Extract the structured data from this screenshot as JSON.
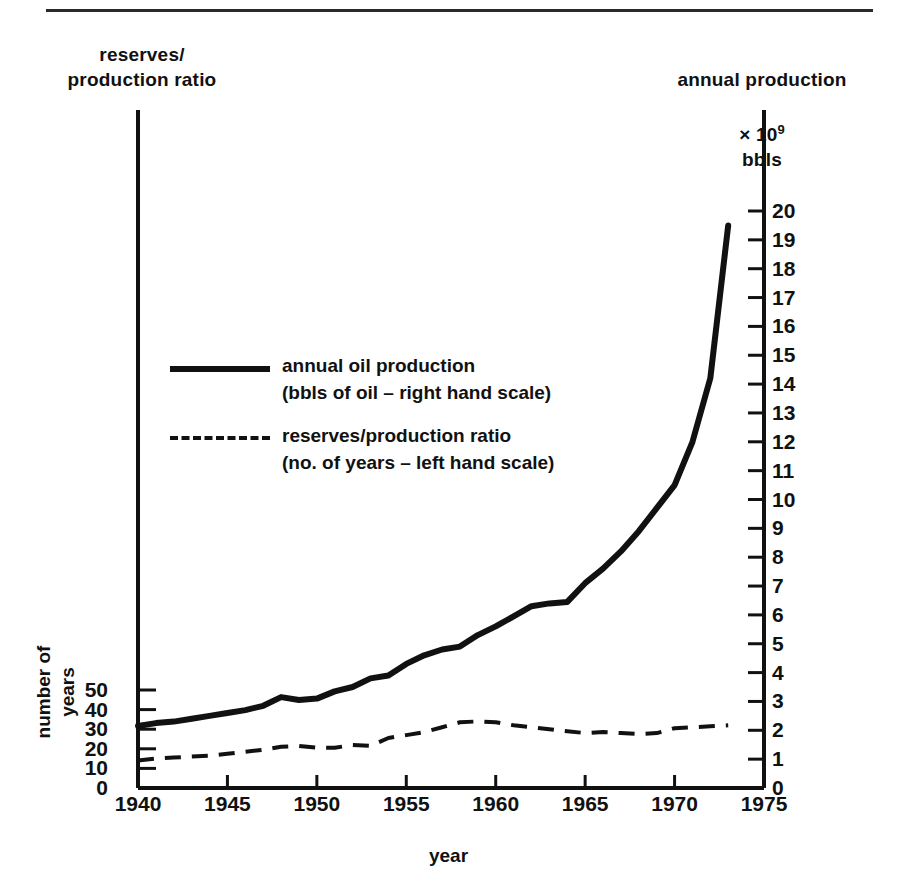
{
  "figure": {
    "left_axis_caption": "reserves/\nproduction ratio",
    "right_axis_caption_line1": "annual production",
    "right_axis_caption_mult": "× 10",
    "right_axis_caption_exp": "9",
    "right_axis_caption_unit": "bbls",
    "left_axis_title": "number of\nyears",
    "x_axis_title": "year"
  },
  "legend": {
    "entries": [
      {
        "style": "solid",
        "label": "annual oil production\n(bbls of oil – right hand scale)"
      },
      {
        "style": "dashed",
        "label": "reserves/production ratio\n(no. of years – left hand scale)"
      }
    ]
  },
  "chart_data": {
    "type": "line",
    "title": "",
    "xlabel": "year",
    "grid": false,
    "legend_position": "inside-upper-left",
    "x_ticks": [
      "1940",
      "1945",
      "1950",
      "1955",
      "1960",
      "1965",
      "1970",
      "1975"
    ],
    "xlim": [
      1940,
      1975
    ],
    "left_axis": {
      "label": "number of years",
      "caption": "reserves/production ratio",
      "ylim": [
        0,
        60
      ],
      "ticks": [
        "0",
        "10",
        "20",
        "30",
        "40",
        "50"
      ],
      "tick_values": [
        0,
        10,
        20,
        30,
        40,
        50
      ]
    },
    "right_axis": {
      "label": "annual production × 10^9 bbls",
      "ylim": [
        0,
        20.5
      ],
      "ticks": [
        "0",
        "1",
        "2",
        "3",
        "4",
        "5",
        "6",
        "7",
        "8",
        "9",
        "10",
        "11",
        "12",
        "13",
        "14",
        "15",
        "16",
        "17",
        "18",
        "19",
        "20"
      ],
      "tick_values": [
        0,
        1,
        2,
        3,
        4,
        5,
        6,
        7,
        8,
        9,
        10,
        11,
        12,
        13,
        14,
        15,
        16,
        17,
        18,
        19,
        20
      ]
    },
    "series": [
      {
        "name": "annual oil production",
        "axis": "right",
        "unit": "10^9 bbls",
        "style": "solid",
        "x": [
          1940,
          1941,
          1942,
          1943,
          1944,
          1945,
          1946,
          1947,
          1948,
          1949,
          1950,
          1951,
          1952,
          1953,
          1954,
          1955,
          1956,
          1957,
          1958,
          1959,
          1960,
          1961,
          1962,
          1963,
          1964,
          1965,
          1966,
          1967,
          1968,
          1969,
          1970,
          1971,
          1972,
          1973
        ],
        "values": [
          2.15,
          2.25,
          2.3,
          2.4,
          2.5,
          2.6,
          2.7,
          2.85,
          3.15,
          3.05,
          3.1,
          3.35,
          3.5,
          3.8,
          3.9,
          4.3,
          4.6,
          4.8,
          4.9,
          5.3,
          5.6,
          5.95,
          6.3,
          6.4,
          6.45,
          7.1,
          7.6,
          8.2,
          8.9,
          9.7,
          10.5,
          12.0,
          14.2,
          19.5
        ]
      },
      {
        "name": "reserves/production ratio",
        "axis": "left",
        "unit": "years",
        "style": "dashed",
        "x": [
          1940,
          1941,
          1942,
          1943,
          1944,
          1945,
          1946,
          1947,
          1948,
          1949,
          1950,
          1951,
          1952,
          1953,
          1954,
          1955,
          1956,
          1957,
          1958,
          1959,
          1960,
          1961,
          1962,
          1963,
          1964,
          1965,
          1966,
          1967,
          1968,
          1969,
          1970,
          1971,
          1972,
          1973
        ],
        "values": [
          14.0,
          15.0,
          15.5,
          16.0,
          16.5,
          17.5,
          18.5,
          19.5,
          21.0,
          21.5,
          20.5,
          20.5,
          22.0,
          21.5,
          25.5,
          27.0,
          28.5,
          31.0,
          33.5,
          34.0,
          33.5,
          32.0,
          31.0,
          30.0,
          29.0,
          28.0,
          28.5,
          28.0,
          27.5,
          28.0,
          30.5,
          31.0,
          31.5,
          32.0
        ]
      }
    ]
  }
}
